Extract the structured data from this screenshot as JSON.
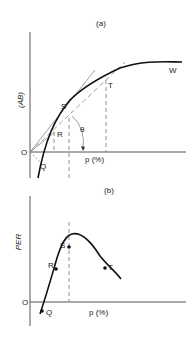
{
  "panel_a": {
    "title": "(a)",
    "ylabel": "(AB)",
    "xlabel": "p (%)",
    "origin": "O",
    "points": {
      "Q": "Q",
      "R": "R",
      "S": "S",
      "T": "T",
      "W": "W"
    },
    "angle": "θ"
  },
  "panel_b": {
    "title": "(b)",
    "ylabel": "PER",
    "xlabel": "p (%)",
    "origin": "O",
    "points": {
      "Q": "Q",
      "R": "R",
      "S": "S",
      "T": "T"
    }
  }
}
